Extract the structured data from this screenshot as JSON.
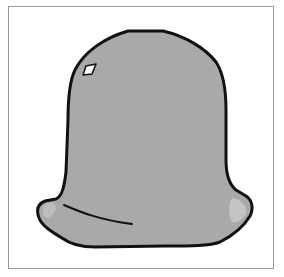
{
  "illustration": {
    "subject": "bell",
    "colors": {
      "background": "#ffffff",
      "frame_border": "#9a9a9a",
      "bell_fill": "#a9a9a9",
      "bell_outline": "#111111",
      "lip_highlight": "#c4c4c4",
      "window_fill": "#ffffff"
    }
  }
}
